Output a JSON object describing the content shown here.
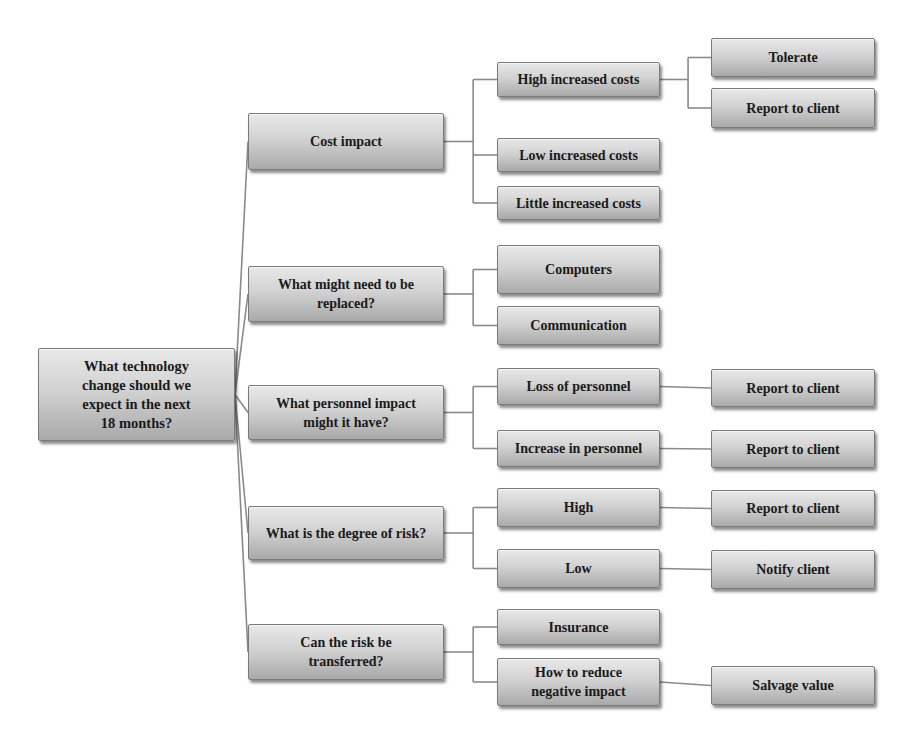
{
  "diagram": {
    "type": "decision-tree",
    "root": {
      "id": "root",
      "label": "What technology\nchange should we\nexpect in the next\n18 months?",
      "box": [
        38,
        348,
        197,
        93
      ]
    },
    "level1": [
      {
        "id": "cost",
        "label": "Cost impact",
        "box": [
          248,
          113,
          196,
          57
        ]
      },
      {
        "id": "replace",
        "label": "What might need to be\nreplaced?",
        "box": [
          248,
          266,
          196,
          56
        ]
      },
      {
        "id": "personnel",
        "label": "What personnel impact\nmight it have?",
        "box": [
          248,
          385,
          196,
          55
        ]
      },
      {
        "id": "risk",
        "label": "What is the degree of risk?",
        "box": [
          248,
          506,
          196,
          54
        ]
      },
      {
        "id": "transfer",
        "label": "Can the risk be\ntransferred?",
        "box": [
          248,
          624,
          196,
          56
        ]
      }
    ],
    "level2": [
      {
        "id": "high-inc",
        "parent": "cost",
        "label": "High increased costs",
        "box": [
          497,
          62,
          163,
          35
        ]
      },
      {
        "id": "low-inc",
        "parent": "cost",
        "label": "Low increased costs",
        "box": [
          497,
          138,
          163,
          34
        ]
      },
      {
        "id": "little-inc",
        "parent": "cost",
        "label": "Little increased costs",
        "box": [
          497,
          186,
          163,
          34
        ]
      },
      {
        "id": "computers",
        "parent": "replace",
        "label": "Computers",
        "box": [
          497,
          245,
          163,
          49
        ]
      },
      {
        "id": "communication",
        "parent": "replace",
        "label": "Communication",
        "box": [
          497,
          306,
          163,
          39
        ]
      },
      {
        "id": "loss-personnel",
        "parent": "personnel",
        "label": "Loss of personnel",
        "box": [
          497,
          368,
          163,
          37
        ]
      },
      {
        "id": "increase-personnel",
        "parent": "personnel",
        "label": "Increase in personnel",
        "box": [
          497,
          430,
          163,
          37
        ]
      },
      {
        "id": "risk-high",
        "parent": "risk",
        "label": "High",
        "box": [
          497,
          488,
          163,
          39
        ]
      },
      {
        "id": "risk-low",
        "parent": "risk",
        "label": "Low",
        "box": [
          497,
          549,
          163,
          39
        ]
      },
      {
        "id": "insurance",
        "parent": "transfer",
        "label": "Insurance",
        "box": [
          497,
          609,
          163,
          36
        ]
      },
      {
        "id": "reduce-impact",
        "parent": "transfer",
        "label": "How to reduce\nnegative impact",
        "box": [
          497,
          658,
          163,
          48
        ]
      }
    ],
    "level3": [
      {
        "id": "tolerate",
        "parent": "high-inc",
        "label": "Tolerate",
        "box": [
          711,
          38,
          164,
          39
        ]
      },
      {
        "id": "report-1",
        "parent": "high-inc",
        "label": "Report to client",
        "box": [
          711,
          88,
          164,
          40
        ]
      },
      {
        "id": "report-2",
        "parent": "loss-personnel",
        "label": "Report to client",
        "box": [
          711,
          369,
          164,
          38
        ]
      },
      {
        "id": "report-3",
        "parent": "increase-personnel",
        "label": "Report to client",
        "box": [
          711,
          430,
          164,
          38
        ]
      },
      {
        "id": "report-4",
        "parent": "risk-high",
        "label": "Report to client",
        "box": [
          711,
          490,
          164,
          37
        ]
      },
      {
        "id": "notify",
        "parent": "risk-low",
        "label": "Notify client",
        "box": [
          711,
          550,
          164,
          39
        ]
      },
      {
        "id": "salvage",
        "parent": "reduce-impact",
        "label": "Salvage value",
        "box": [
          711,
          666,
          164,
          39
        ]
      }
    ],
    "colors": {
      "connector": "#8a8a8a",
      "box_top": "#e8e8e8",
      "box_bottom": "#a9a9a9",
      "text": "#1a1a1a"
    }
  }
}
